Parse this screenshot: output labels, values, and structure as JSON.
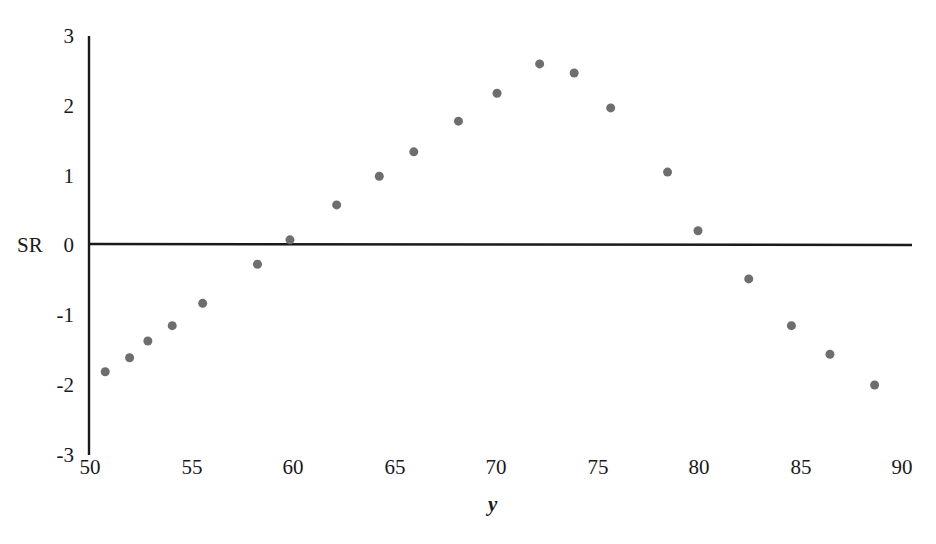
{
  "chart_data": {
    "type": "scatter",
    "title": "",
    "xlabel": "y",
    "ylabel": "SR",
    "xlim": [
      50,
      90
    ],
    "ylim": [
      -3,
      3
    ],
    "xticks": [
      50,
      55,
      60,
      65,
      70,
      75,
      80,
      85,
      90
    ],
    "yticks": [
      -3,
      -2,
      -1,
      0,
      1,
      2,
      3
    ],
    "xtick_labels": [
      "50",
      "55",
      "60",
      "65",
      "70",
      "75",
      "80",
      "85",
      "90"
    ],
    "ytick_labels": [
      "-3",
      "-2",
      "-1",
      "0",
      "1",
      "2",
      "3"
    ],
    "grid": false,
    "legend": null,
    "zero_line": 0,
    "marker_color": "#6e6e6e",
    "axis_color": "#1a1a1a",
    "marker_size": 9,
    "x": [
      50.8,
      52.0,
      52.9,
      54.1,
      55.6,
      58.3,
      59.9,
      62.2,
      64.3,
      66.0,
      68.2,
      70.1,
      72.2,
      73.9,
      75.7,
      78.5,
      80.0,
      82.5,
      84.6,
      86.5,
      88.7
    ],
    "y": [
      -1.83,
      -1.63,
      -1.39,
      -1.17,
      -0.85,
      -0.29,
      0.06,
      0.56,
      0.97,
      1.32,
      1.76,
      2.16,
      2.58,
      2.45,
      1.95,
      1.03,
      0.19,
      -0.5,
      -1.17,
      -1.58,
      -2.02
    ],
    "series": [
      {
        "name": "standardized residuals",
        "points": [
          [
            50.8,
            -1.83
          ],
          [
            52.0,
            -1.63
          ],
          [
            52.9,
            -1.39
          ],
          [
            54.1,
            -1.17
          ],
          [
            55.6,
            -0.85
          ],
          [
            58.3,
            -0.29
          ],
          [
            59.9,
            0.06
          ],
          [
            62.2,
            0.56
          ],
          [
            64.3,
            0.97
          ],
          [
            66.0,
            1.32
          ],
          [
            68.2,
            1.76
          ],
          [
            70.1,
            2.16
          ],
          [
            72.2,
            2.58
          ],
          [
            73.9,
            2.45
          ],
          [
            75.7,
            1.95
          ],
          [
            78.5,
            1.03
          ],
          [
            80.0,
            0.19
          ],
          [
            82.5,
            -0.5
          ],
          [
            84.6,
            -1.17
          ],
          [
            86.5,
            -1.58
          ],
          [
            88.7,
            -2.02
          ]
        ]
      }
    ]
  }
}
